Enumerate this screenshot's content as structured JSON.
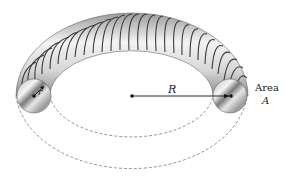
{
  "diagram": {
    "labels": {
      "major_radius": "R",
      "minor_radius": "r",
      "area_word": "Area",
      "area_symbol": "A"
    },
    "colors": {
      "wire": "#3a3a3a",
      "core_light": "#f2f2f2",
      "core_dark": "#8c8c8c",
      "dashed": "#777777",
      "dot": "#111111"
    }
  }
}
